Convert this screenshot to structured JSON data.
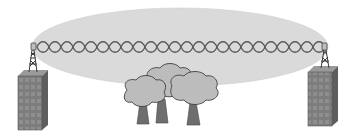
{
  "diagram": {
    "elements": {
      "fresnel_zone": {
        "label": "fresnel-zone-ellipse",
        "color": "#d9d9d9"
      },
      "signal_path": {
        "label": "radio-signal-wave",
        "color": "#555555"
      },
      "left_site": {
        "label": "left-building-with-antenna",
        "color": "#7a7a7a"
      },
      "right_site": {
        "label": "right-building-with-antenna",
        "color": "#7a7a7a"
      },
      "obstruction": {
        "label": "trees",
        "count": 3,
        "color": "#b8b8b8"
      }
    }
  }
}
